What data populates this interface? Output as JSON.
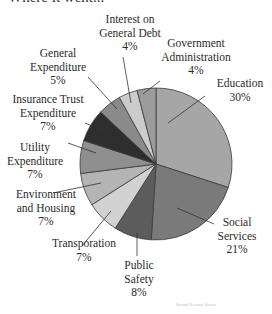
{
  "chart_data": {
    "type": "pie",
    "title": "Where it went...",
    "start": "12 o'clock",
    "direction": "clockwise",
    "unit": "%",
    "slices": [
      {
        "label": [
          "Education"
        ],
        "pct_label": "30%",
        "value": 30,
        "color": "#a6a6a6"
      },
      {
        "label": [
          "Social",
          "Services"
        ],
        "pct_label": "21%",
        "value": 21,
        "color": "#7a7a7a"
      },
      {
        "label": [
          "Public",
          "Safety"
        ],
        "pct_label": "8%",
        "value": 8,
        "color": "#5c5c5c"
      },
      {
        "label": [
          "Transporation"
        ],
        "pct_label": "7%",
        "value": 7,
        "color": "#d2d2d2"
      },
      {
        "label": [
          "Environment",
          "and Housing"
        ],
        "pct_label": "7%",
        "value": 7,
        "color": "#b4b4b4"
      },
      {
        "label": [
          "Utility",
          "Expenditure"
        ],
        "pct_label": "7%",
        "value": 7,
        "color": "#8f8f8f"
      },
      {
        "label": [
          "Insurance Trust",
          "Expenditure"
        ],
        "pct_label": "7%",
        "value": 7,
        "color": "#2e2e2e"
      },
      {
        "label": [
          "General",
          "Expenditure"
        ],
        "pct_label": "5%",
        "value": 5,
        "color": "#8a8a8a"
      },
      {
        "label": [
          "Interest on",
          "General Debt"
        ],
        "pct_label": "4%",
        "value": 4,
        "color": "#cccccc"
      },
      {
        "label": [
          "Government",
          "Administration"
        ],
        "pct_label": "4%",
        "value": 4,
        "color": "#9c9c9c"
      }
    ]
  },
  "footer": {
    "source": "Internal Revenue Service"
  }
}
